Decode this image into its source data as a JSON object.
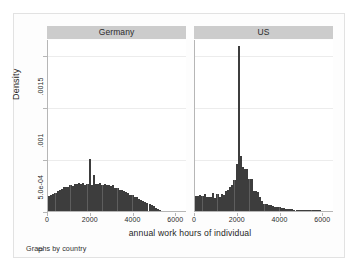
{
  "figure": {
    "xlabel": "annual work hours of individual",
    "ylabel": "Density",
    "footnote": "Graphs by country",
    "panel_titles": [
      "Germany",
      "US"
    ],
    "colors": {
      "bar_fill": "#5e5e5e",
      "bar_outline": "#3d3d3d",
      "strip_background": "#cccccc",
      "plot_background": "#ffffff",
      "figure_background": "#fdfdfd",
      "gridline": "#ececec",
      "axis": "#b6b6b6"
    }
  },
  "chart_data": {
    "type": "bar",
    "title": "",
    "subtitle": "",
    "xlabel": "annual work hours of individual",
    "ylabel": "Density",
    "footnote": "Graphs by country",
    "grid": "horizontal",
    "legend_position": "none",
    "xlim": [
      0,
      6500
    ],
    "ylim": [
      0,
      0.00165
    ],
    "xticks": [
      0,
      2000,
      4000,
      6000
    ],
    "xtick_labels": [
      "0",
      "2000",
      "4000",
      "6000"
    ],
    "yticks": [
      0,
      0.0005,
      0.001,
      0.0015
    ],
    "ytick_labels": [
      "0",
      "5.0e-04",
      ".001",
      ".0015"
    ],
    "bin_width": 100,
    "panels": [
      {
        "name": "Germany",
        "x": [
          50,
          150,
          250,
          350,
          450,
          550,
          650,
          750,
          850,
          950,
          1050,
          1150,
          1250,
          1350,
          1450,
          1550,
          1650,
          1750,
          1850,
          1950,
          2050,
          2150,
          2250,
          2350,
          2450,
          2550,
          2650,
          2750,
          2850,
          2950,
          3050,
          3150,
          3250,
          3350,
          3450,
          3550,
          3650,
          3750,
          3850,
          3950,
          4050,
          4150,
          4250,
          4350,
          4450,
          4550,
          4650,
          4750,
          4850,
          4950,
          5050,
          5150,
          5250
        ],
        "values": [
          0.000145,
          0.00015,
          0.00016,
          0.000175,
          0.00019,
          0.0002,
          0.000215,
          0.00023,
          0.00023,
          0.000235,
          0.00025,
          0.00024,
          0.000262,
          0.000258,
          0.00027,
          0.000258,
          0.000265,
          0.00025,
          0.000262,
          0.000495,
          0.00025,
          0.000342,
          0.000255,
          0.000258,
          0.000265,
          0.00025,
          0.000258,
          0.000248,
          0.000248,
          0.000238,
          0.000245,
          0.000218,
          0.000222,
          0.000205,
          0.0002,
          0.000188,
          0.000178,
          0.000172,
          0.000158,
          0.00015,
          0.000138,
          0.00013,
          0.000118,
          0.00011,
          9.8e-05,
          8.8e-05,
          8e-05,
          7e-05,
          5.8e-05,
          4.8e-05,
          3.2e-05,
          1.8e-05,
          8e-06
        ]
      },
      {
        "name": "US",
        "x": [
          50,
          150,
          250,
          350,
          450,
          550,
          650,
          750,
          850,
          950,
          1050,
          1150,
          1250,
          1350,
          1450,
          1550,
          1650,
          1750,
          1850,
          1950,
          2050,
          2150,
          2250,
          2350,
          2450,
          2550,
          2650,
          2750,
          2850,
          2950,
          3050,
          3150,
          3250,
          3350,
          3450,
          3550,
          3650,
          3750,
          3850,
          3950,
          4050,
          4150,
          4250,
          4350,
          4450,
          4550,
          4650,
          4750,
          4850,
          4950,
          5050,
          5150,
          5250,
          5350,
          5450,
          5550,
          5650,
          5750,
          5850
        ],
        "values": [
          0.000148,
          0.000145,
          0.00015,
          0.000142,
          0.000168,
          0.00013,
          0.000135,
          0.000132,
          0.000172,
          0.000128,
          0.000165,
          0.000132,
          0.000162,
          0.000158,
          0.00019,
          0.000205,
          0.000235,
          0.000248,
          0.0003,
          0.000455,
          0.00158,
          0.00053,
          0.000425,
          0.000402,
          0.0004,
          0.00031,
          0.000305,
          0.000192,
          0.000188,
          0.000185,
          0.00013,
          9.8e-05,
          7.2e-05,
          6.5e-05,
          6e-05,
          5.8e-05,
          4.8e-05,
          4.2e-05,
          4e-05,
          3.5e-05,
          3e-05,
          2.5e-05,
          2.2e-05,
          2e-05,
          1.8e-05,
          1.5e-05,
          1.4e-05,
          1.3e-05,
          1.2e-05,
          1.1e-05,
          1e-05,
          9e-06,
          8e-06,
          8e-06,
          7e-06,
          7e-06,
          6e-06,
          6e-06,
          1e-05
        ]
      }
    ]
  }
}
